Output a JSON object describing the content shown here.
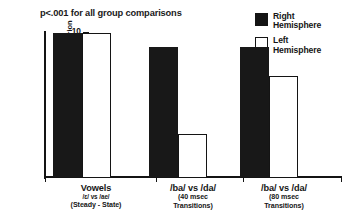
{
  "chart_data": {
    "type": "bar",
    "title": "p<.001 for all group comparisons",
    "xlabel": "",
    "ylabel": "Number of Subjects Reaching Criterion",
    "ylim": [
      0,
      10
    ],
    "ytick_labels": [
      "0",
      "2",
      "4",
      "6",
      "8",
      "10"
    ],
    "ytick_values": [
      0,
      2,
      4,
      6,
      8,
      10
    ],
    "minor_tick_step": 1,
    "grid": false,
    "legend_position": "top-right",
    "categories": [
      "Vowels /ɛ/ vs /ae/ (Steady - State)",
      "/ba/ vs /da/ (40 msec Transitions)",
      "/ba/ vs /da/ (80 msec Transitions)"
    ],
    "series": [
      {
        "name": "Right Hemisphere",
        "color": "#181818",
        "values": [
          10,
          9,
          9
        ]
      },
      {
        "name": "Left Hemisphere",
        "color": "#ffffff",
        "values": [
          10,
          3,
          7
        ]
      }
    ]
  },
  "legend": {
    "items": [
      {
        "line1": "Right",
        "line2": "Hemisphere",
        "style": "filled"
      },
      {
        "line1": "Left",
        "line2": "Hemisphere",
        "style": "hollow"
      }
    ]
  },
  "axis": {
    "y_title": "Number of Subjects Reaching Criterion",
    "ticks": [
      {
        "label": "10"
      },
      {
        "label": "8"
      },
      {
        "label": "6"
      },
      {
        "label": "4"
      },
      {
        "label": "2"
      },
      {
        "label": "0"
      }
    ]
  },
  "groups": [
    {
      "line1": "Vowels",
      "line2": "/ɛ/ vs /ae/",
      "line3": "(Steady - State)",
      "right_value": 10,
      "left_value": 10
    },
    {
      "line1": "/ba/ vs /da/",
      "line2": "(40 msec",
      "line3": "Transitions)",
      "right_value": 9,
      "left_value": 3
    },
    {
      "line1": "/ba/ vs /da/",
      "line2": "(80 msec",
      "line3": "Transitions)",
      "right_value": 9,
      "left_value": 7
    }
  ]
}
